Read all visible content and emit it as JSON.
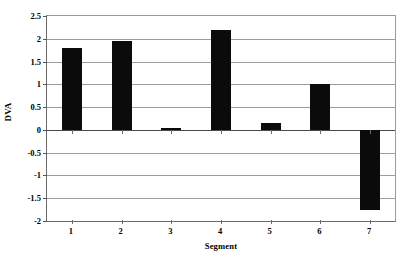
{
  "chart_data": {
    "type": "bar",
    "title": "",
    "xlabel": "Segment",
    "ylabel": "DVA",
    "categories": [
      "1",
      "2",
      "3",
      "4",
      "5",
      "6",
      "7"
    ],
    "values": [
      1.8,
      1.96,
      0.05,
      2.2,
      0.15,
      1.0,
      -1.75
    ],
    "series": [
      {
        "name": "DVA",
        "values": [
          1.8,
          1.96,
          0.05,
          2.2,
          0.15,
          1.0,
          -1.75
        ]
      }
    ],
    "ylim": [
      -2,
      2.5
    ],
    "ytick_values": [
      2.5,
      2,
      1.5,
      1,
      0.5,
      0,
      -0.5,
      -1,
      -1.5,
      -2
    ],
    "ytick_labels": [
      "2.5",
      "2",
      "1.5",
      "1",
      "0.5",
      "0",
      "-0.5",
      "-1",
      "-1.5",
      "-2"
    ],
    "grid": true,
    "legend": false,
    "legend_position": "none",
    "bar_color": "#0b0b0b",
    "gridline_color": "#9d9d9d",
    "axis_color": "#6b6b6b",
    "background_color": "#ffffff"
  }
}
